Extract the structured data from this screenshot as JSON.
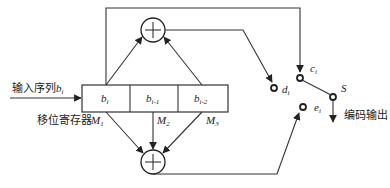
{
  "diagram": {
    "input_label": "输入序列",
    "input_var": "b",
    "input_sub": "i",
    "register_label": "移位寄存器",
    "output_label": "编码输出",
    "cells": [
      {
        "var": "b",
        "sub": "i"
      },
      {
        "var": "b",
        "sub": "i-1"
      },
      {
        "var": "b",
        "sub": "i-2"
      }
    ],
    "taps": [
      {
        "var": "M",
        "sub": "1"
      },
      {
        "var": "M",
        "sub": "2"
      },
      {
        "var": "M",
        "sub": "3"
      }
    ],
    "terminals": {
      "c": {
        "var": "c",
        "sub": "i"
      },
      "d": {
        "var": "d",
        "sub": "i"
      },
      "e": {
        "var": "e",
        "sub": "i"
      }
    },
    "switch_label": "S",
    "xor_symbol": "+"
  }
}
